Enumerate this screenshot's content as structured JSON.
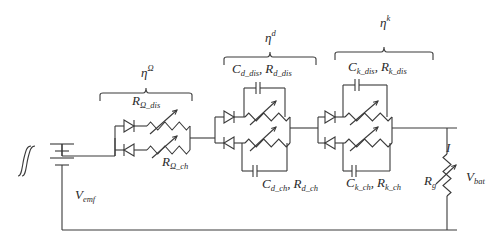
{
  "diagram": {
    "type": "equivalent-circuit",
    "source": {
      "symbol": "hysteresis",
      "label": "V",
      "label_sub": "emf"
    },
    "blocks": [
      {
        "id": "ohmic",
        "eta_label": "η",
        "eta_sup": "Ω",
        "upper_resistor": {
          "label": "R",
          "sub": "Ω_dis"
        },
        "lower_resistor": {
          "label": "R",
          "sub": "Ω_ch"
        }
      },
      {
        "id": "diffusion",
        "eta_label": "η",
        "eta_sup": "d",
        "upper_rc": {
          "c": "C",
          "c_sub": "d_dis",
          "sep": ",",
          "r": "R",
          "r_sub": "d_dis"
        },
        "lower_rc": {
          "c": "C",
          "c_sub": "d_ch",
          "sep": ",",
          "r": "R",
          "r_sub": "d_ch"
        }
      },
      {
        "id": "kinetic",
        "eta_label": "η",
        "eta_sup": "k",
        "upper_rc": {
          "c": "C",
          "c_sub": "k_dis",
          "sep": ",",
          "r": "R",
          "r_sub": "k_dis"
        },
        "lower_rc": {
          "c": "C",
          "c_sub": "k_ch",
          "sep": ",",
          "r": "R",
          "r_sub": "k_ch"
        }
      }
    ],
    "current_label": "I",
    "load": {
      "label": "R",
      "sub": "g"
    },
    "terminal_voltage": {
      "label": "V",
      "sub": "bat"
    }
  }
}
